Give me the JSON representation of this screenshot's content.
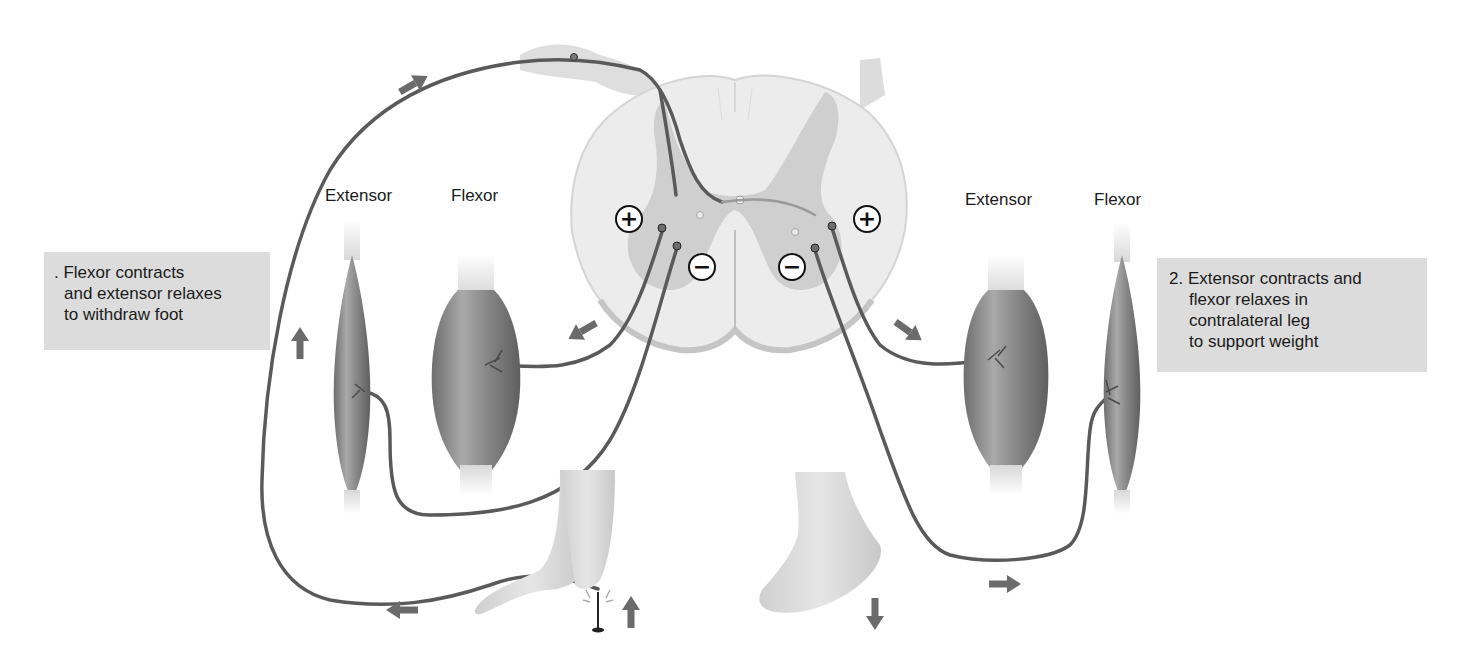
{
  "diagram": {
    "type": "crossed-extensor-reflex",
    "labels": {
      "left_extensor": "Extensor",
      "left_flexor": "Flexor",
      "right_extensor": "Extensor",
      "right_flexor": "Flexor"
    },
    "callouts": {
      "left": {
        "lines": [
          ". Flexor contracts",
          "and extensor relaxes",
          "to withdraw foot"
        ]
      },
      "right": {
        "lines": [
          "2. Extensor contracts and",
          "flexor relaxes in",
          "contralateral leg",
          "to support weight"
        ]
      }
    },
    "signs": {
      "left_excitatory": "+",
      "left_inhibitory": "−",
      "right_excitatory": "+",
      "right_inhibitory": "−"
    },
    "colors": {
      "nerve": "#5a5a5a",
      "arrow": "#6b6b6b",
      "muscle_dark": "#7a7a7a",
      "muscle_light": "#bdbdbd",
      "cord_white_matter": "#ececec",
      "cord_gray_matter": "#cfcfcf",
      "callout_bg": "#dcdcdc",
      "skin": "#d6d6d6"
    },
    "arrows": [
      {
        "id": "afferent-up-right",
        "direction": "up-right"
      },
      {
        "id": "left-extensor-up",
        "direction": "up"
      },
      {
        "id": "left-flexor-down-left",
        "direction": "down-left"
      },
      {
        "id": "right-extensor-down-right",
        "direction": "down-right"
      },
      {
        "id": "left-foot-left",
        "direction": "left"
      },
      {
        "id": "left-foot-up",
        "direction": "up"
      },
      {
        "id": "right-foot-down",
        "direction": "down"
      },
      {
        "id": "right-nerve-right",
        "direction": "right"
      }
    ]
  }
}
